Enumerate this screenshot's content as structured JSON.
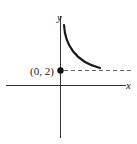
{
  "diagram": {
    "type": "function-graph",
    "axes": {
      "x_label": "x",
      "y_label": "y"
    },
    "point": {
      "label": "(0, 2)",
      "x": 0,
      "y": 2,
      "filled": true
    },
    "asymptote": {
      "type": "horizontal",
      "y": 2,
      "style": "dashed"
    },
    "curve": {
      "description": "decreasing curve approaching y = 2 from above, steep near the y-axis",
      "color": "#1a1a1a"
    },
    "colors": {
      "axis": "#333333",
      "curve": "#1a1a1a",
      "dashed": "#666666",
      "point": "#111111"
    }
  }
}
